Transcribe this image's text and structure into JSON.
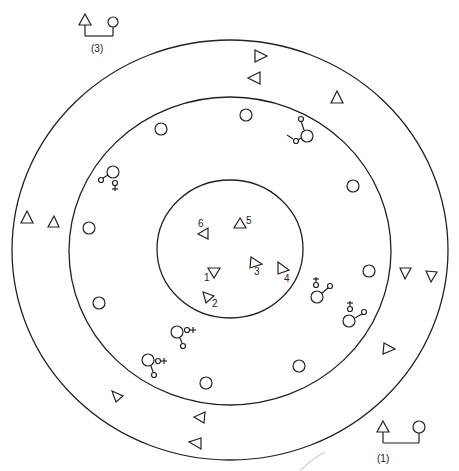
{
  "diagram": {
    "type": "concentric-circle kinship/social-network diagram",
    "rings": {
      "outer": {
        "cx": 230,
        "cy": 250,
        "rx": 218,
        "ry": 210
      },
      "middle": {
        "cx": 230,
        "cy": 251,
        "rx": 161,
        "ry": 154
      },
      "inner": {
        "cx": 230,
        "cy": 249,
        "rx": 73,
        "ry": 69
      }
    },
    "legends": [
      {
        "label": "(3)",
        "x": 92,
        "y": 38
      },
      {
        "label": "(1)",
        "x": 398,
        "y": 464
      }
    ],
    "inner_triangles": [
      {
        "label": "1",
        "x": 214,
        "y": 271,
        "dir": "down"
      },
      {
        "label": "2",
        "x": 209,
        "y": 297,
        "dir": "down-right"
      },
      {
        "label": "3",
        "x": 254,
        "y": 262,
        "dir": "right"
      },
      {
        "label": "4",
        "x": 283,
        "y": 268,
        "dir": "right"
      },
      {
        "label": "5",
        "x": 241,
        "y": 222,
        "dir": "up"
      },
      {
        "label": "6",
        "x": 205,
        "y": 233,
        "dir": "left"
      }
    ],
    "middle_circles": [
      {
        "x": 161,
        "y": 129
      },
      {
        "x": 246,
        "y": 115
      },
      {
        "x": 89,
        "y": 228
      },
      {
        "x": 353,
        "y": 186
      },
      {
        "x": 369,
        "y": 271
      },
      {
        "x": 99,
        "y": 303
      },
      {
        "x": 299,
        "y": 366
      },
      {
        "x": 206,
        "y": 383
      }
    ],
    "middle_couples": [
      {
        "x": 307,
        "y": 136,
        "label": "female-linked-up-male-left"
      },
      {
        "x": 113,
        "y": 172,
        "label": "male-left-female-below"
      },
      {
        "x": 317,
        "y": 297,
        "label": "male-above-female-right"
      },
      {
        "x": 349,
        "y": 321,
        "label": "male-above-female-right"
      },
      {
        "x": 177,
        "y": 332,
        "label": "male-right-female-below"
      },
      {
        "x": 148,
        "y": 360,
        "label": "male-right-female-below"
      }
    ],
    "outer_triangles": [
      {
        "x": 260,
        "y": 55,
        "dir": "right"
      },
      {
        "x": 254,
        "y": 78,
        "dir": "left"
      },
      {
        "x": 337,
        "y": 97,
        "dir": "up"
      },
      {
        "x": 27,
        "y": 217,
        "dir": "up"
      },
      {
        "x": 53,
        "y": 222,
        "dir": "up"
      },
      {
        "x": 405,
        "y": 273,
        "dir": "down"
      },
      {
        "x": 431,
        "y": 277,
        "dir": "down"
      },
      {
        "x": 388,
        "y": 348,
        "dir": "right"
      },
      {
        "x": 117,
        "y": 396,
        "dir": "right"
      },
      {
        "x": 199,
        "y": 416,
        "dir": "left"
      },
      {
        "x": 194,
        "y": 442,
        "dir": "left"
      }
    ]
  }
}
